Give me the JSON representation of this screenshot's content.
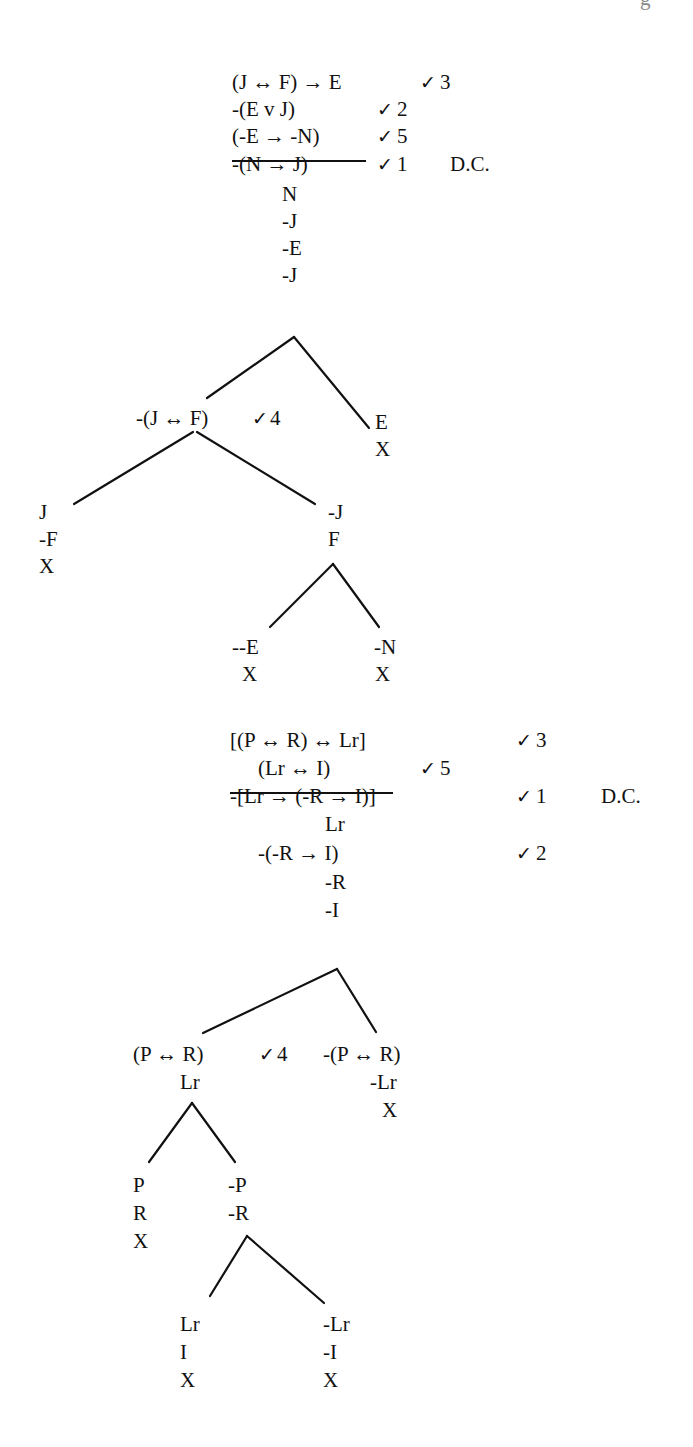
{
  "page_header_fragment": "g",
  "tree1": {
    "premises": [
      {
        "formula": "(J ↔ F) → E",
        "check": "✓",
        "order": "3"
      },
      {
        "formula": "-(E v J)",
        "check": "✓",
        "order": "2"
      },
      {
        "formula": "(-E → -N)",
        "check": "✓",
        "order": "5",
        "underlined": true
      },
      {
        "formula": "-(N → J)",
        "check": "✓",
        "order": "1",
        "note": "D.C."
      }
    ],
    "trunk": [
      "N",
      "-J",
      "-E",
      "-J"
    ],
    "branch_left": {
      "formula": "-(J ↔ F)",
      "check": "✓",
      "order": "4"
    },
    "branch_right": [
      "E",
      "X"
    ],
    "sub_left": [
      "J",
      "-F",
      "X"
    ],
    "sub_right": [
      "-J",
      "F"
    ],
    "leaf_left": [
      "--E",
      "X"
    ],
    "leaf_right": [
      "-N",
      "X"
    ]
  },
  "tree2": {
    "premises": [
      {
        "formula": "[(P ↔ R) ↔ Lr]",
        "check": "✓",
        "order": "3"
      },
      {
        "formula": "(Lr ↔ I)",
        "check": "✓",
        "order": "5",
        "underlined": true
      },
      {
        "formula": "-[Lr → (-R → I)]",
        "check": "✓",
        "order": "1",
        "note": "D.C."
      }
    ],
    "trunk_1": "Lr",
    "trunk_2": {
      "formula": "-(-R → I)",
      "check": "✓",
      "order": "2"
    },
    "trunk_rest": [
      "-R",
      "-I"
    ],
    "branch_left": {
      "formula": "(P ↔ R)",
      "check": "✓",
      "order": "4",
      "below": "Lr"
    },
    "branch_right": [
      "-(P ↔ R)",
      "-Lr",
      "X"
    ],
    "sub_left": [
      "P",
      "R",
      "X"
    ],
    "sub_right": [
      "-P",
      "-R"
    ],
    "leaf_left": [
      "Lr",
      "I",
      "X"
    ],
    "leaf_right": [
      "-Lr",
      "-I",
      "X"
    ]
  }
}
